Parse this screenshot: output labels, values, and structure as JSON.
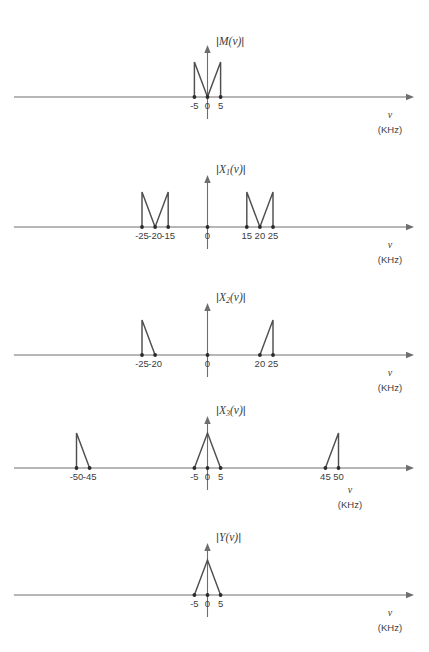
{
  "figure": {
    "axis_variable": "v",
    "axis_unit": "(KHz)",
    "line_color": "#4f4f4f",
    "axis_color": "#6e6e6e",
    "marker_color": "#2b2b2b",
    "background": "#ffffff"
  },
  "chart_data": [
    {
      "type": "line",
      "title": "|M(v)|",
      "label_parts": {
        "open_bar": "|",
        "fn": "M",
        "sub": "",
        "arg": "(v)",
        "close_bar": "|"
      },
      "xlabel": "v",
      "xunit": "(KHz)",
      "grid": false,
      "legend": "none",
      "xlim": [
        -60,
        60
      ],
      "ylim": [
        0,
        1
      ],
      "tick_labels": [
        "-5",
        "0",
        "5"
      ],
      "tick_values": [
        -5,
        0,
        5
      ],
      "marker_points": [
        -5,
        0,
        5
      ],
      "shape_description": "M-shape: vertical edges at -5 and +5 rising to peak height, slopes descending to zero at origin",
      "segments": [
        {
          "points": [
            [
              -5,
              0
            ],
            [
              -5,
              1
            ],
            [
              0,
              0
            ]
          ]
        },
        {
          "points": [
            [
              0,
              0
            ],
            [
              5,
              1
            ],
            [
              5,
              0
            ]
          ]
        }
      ]
    },
    {
      "type": "line",
      "title": "|X1(v)|",
      "label_parts": {
        "open_bar": "|",
        "fn": "X",
        "sub": "1",
        "arg": "(v)",
        "close_bar": "|"
      },
      "xlabel": "v",
      "xunit": "(KHz)",
      "grid": false,
      "legend": "none",
      "xlim": [
        -60,
        60
      ],
      "ylim": [
        0,
        1
      ],
      "tick_labels": [
        "-25",
        "-20",
        "-15",
        "0",
        "15",
        "20",
        "25"
      ],
      "tick_values": [
        -25,
        -20,
        -15,
        0,
        15,
        20,
        25
      ],
      "marker_points": [
        -25,
        -20,
        -15,
        0,
        15,
        20,
        25
      ],
      "shape_description": "Two M-shapes centered at -20 and +20, each spanning 10 KHz wide",
      "segments": [
        {
          "points": [
            [
              -25,
              0
            ],
            [
              -25,
              1
            ],
            [
              -20,
              0
            ]
          ]
        },
        {
          "points": [
            [
              -20,
              0
            ],
            [
              -15,
              1
            ],
            [
              -15,
              0
            ]
          ]
        },
        {
          "points": [
            [
              15,
              0
            ],
            [
              15,
              1
            ],
            [
              20,
              0
            ]
          ]
        },
        {
          "points": [
            [
              20,
              0
            ],
            [
              25,
              1
            ],
            [
              25,
              0
            ]
          ]
        }
      ]
    },
    {
      "type": "line",
      "title": "|X2(v)|",
      "label_parts": {
        "open_bar": "|",
        "fn": "X",
        "sub": "2",
        "arg": "(v)",
        "close_bar": "|"
      },
      "xlabel": "v",
      "xunit": "(KHz)",
      "grid": false,
      "legend": "none",
      "xlim": [
        -60,
        60
      ],
      "ylim": [
        0,
        1
      ],
      "tick_labels": [
        "-25",
        "-20",
        "0",
        "20",
        "25"
      ],
      "tick_values": [
        -25,
        -20,
        0,
        20,
        25
      ],
      "marker_points": [
        -25,
        -20,
        0,
        20,
        25
      ],
      "shape_description": "Single sideband triangles: left vertical at -25 sloping down to -20; right slope rising from 20 to vertical at 25",
      "segments": [
        {
          "points": [
            [
              -25,
              0
            ],
            [
              -25,
              1
            ],
            [
              -20,
              0
            ]
          ]
        },
        {
          "points": [
            [
              20,
              0
            ],
            [
              25,
              1
            ],
            [
              25,
              0
            ]
          ]
        }
      ]
    },
    {
      "type": "line",
      "title": "|X3(v)|",
      "label_parts": {
        "open_bar": "|",
        "fn": "X",
        "sub": "3",
        "arg": "(v)",
        "close_bar": "|"
      },
      "xlabel": "v",
      "xunit": "(KHz)",
      "grid": false,
      "legend": "none",
      "xlim": [
        -60,
        60
      ],
      "ylim": [
        0,
        1
      ],
      "tick_labels": [
        "-50",
        "-45",
        "-5",
        "0",
        "5",
        "45",
        "50"
      ],
      "tick_values": [
        -50,
        -45,
        -5,
        0,
        5,
        45,
        50
      ],
      "marker_points": [
        -50,
        -45,
        -5,
        0,
        5,
        45,
        50
      ],
      "shape_description": "Centre triangle peaking at 0 spanning -5 to 5, plus sideband triangles: vertical at -50 sloping to -45, and slope from 45 up to vertical at 50",
      "segments": [
        {
          "points": [
            [
              -50,
              0
            ],
            [
              -50,
              1
            ],
            [
              -45,
              0
            ]
          ]
        },
        {
          "points": [
            [
              -5,
              0
            ],
            [
              0,
              1
            ],
            [
              5,
              0
            ]
          ]
        },
        {
          "points": [
            [
              45,
              0
            ],
            [
              50,
              1
            ],
            [
              50,
              0
            ]
          ]
        }
      ]
    },
    {
      "type": "line",
      "title": "|Y(v)|",
      "label_parts": {
        "open_bar": "|",
        "fn": "Y",
        "sub": "",
        "arg": "(v)",
        "close_bar": "|"
      },
      "xlabel": "v",
      "xunit": "(KHz)",
      "grid": false,
      "legend": "none",
      "xlim": [
        -60,
        60
      ],
      "ylim": [
        0,
        1
      ],
      "tick_labels": [
        "-5",
        "0",
        "5"
      ],
      "tick_values": [
        -5,
        0,
        5
      ],
      "marker_points": [
        -5,
        0,
        5
      ],
      "shape_description": "Single triangle peaking at origin, spanning -5 to 5",
      "segments": [
        {
          "points": [
            [
              -5,
              0
            ],
            [
              0,
              1
            ],
            [
              5,
              0
            ]
          ]
        }
      ]
    }
  ]
}
